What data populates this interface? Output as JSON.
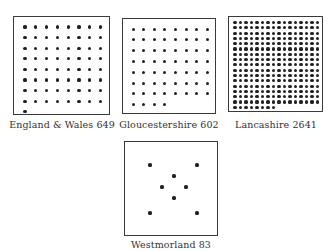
{
  "figure": {
    "panels": [
      {
        "id": "england-wales",
        "region": "England & Wales",
        "value": "649",
        "caption": "England & Wales 649",
        "dots": 65,
        "columns": 8
      },
      {
        "id": "gloucestershire",
        "region": "Gloucestershire",
        "value": "602",
        "caption": "Gloucestershire 602",
        "dots": 60,
        "columns": 8
      },
      {
        "id": "lancashire",
        "region": "Lancashire",
        "value": "2641",
        "caption": "Lancashire 2641",
        "dots": 264,
        "columns": 16
      },
      {
        "id": "westmorland",
        "region": "Westmorland",
        "value": "83",
        "caption": "Westmorland 83",
        "dots": 8,
        "layout": "scattered"
      }
    ],
    "colors": {
      "background": "#ffffff",
      "border": "#3a3a3a",
      "dot": "#222222"
    }
  }
}
